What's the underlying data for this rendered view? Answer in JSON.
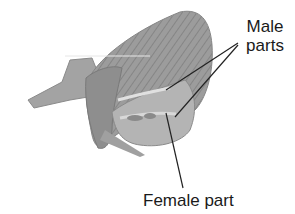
{
  "diagram": {
    "labels": {
      "male_line1": "Male",
      "male_line2": "parts",
      "female": "Female part"
    },
    "colors": {
      "petal": "#9a9a9a",
      "petal_dark": "#7a7a7a",
      "petal_light": "#c4c4c4",
      "leader_line": "#222222",
      "text": "#1a1a1a"
    }
  }
}
